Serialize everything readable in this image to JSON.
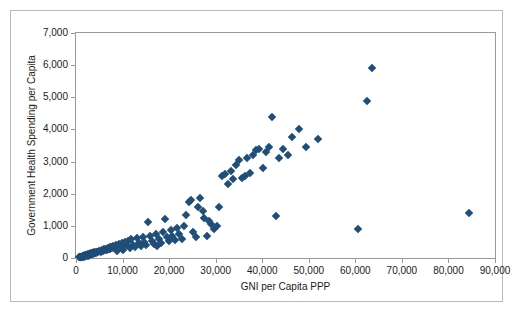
{
  "chart_data": {
    "type": "scatter",
    "title": "",
    "xlabel": "GNI per Capita PPP",
    "ylabel": "Government Health Spending per Capita",
    "xlim": [
      0,
      90000
    ],
    "ylim": [
      0,
      7000
    ],
    "xticks": [
      0,
      10000,
      20000,
      30000,
      40000,
      50000,
      60000,
      70000,
      80000,
      90000
    ],
    "xticklabels": [
      "0",
      "10,000",
      "20,000",
      "30,000",
      "40,000",
      "50,000",
      "60,000",
      "70,000",
      "80,000",
      "90,000"
    ],
    "yticks": [
      0,
      1000,
      2000,
      3000,
      4000,
      5000,
      6000,
      7000
    ],
    "yticklabels": [
      "0",
      "1,000",
      "2,000",
      "3,000",
      "4,000",
      "5,000",
      "6,000",
      "7,000"
    ],
    "grid": false,
    "legend": false,
    "marker": "diamond",
    "marker_color": "#1F4E79",
    "series": [
      {
        "name": "Countries",
        "points": [
          [
            600,
            20
          ],
          [
            800,
            25
          ],
          [
            900,
            30
          ],
          [
            1000,
            35
          ],
          [
            1100,
            40
          ],
          [
            1200,
            45
          ],
          [
            1300,
            30
          ],
          [
            1400,
            55
          ],
          [
            1500,
            60
          ],
          [
            1600,
            50
          ],
          [
            1700,
            70
          ],
          [
            1800,
            45
          ],
          [
            1900,
            80
          ],
          [
            2000,
            60
          ],
          [
            2100,
            90
          ],
          [
            2200,
            70
          ],
          [
            2300,
            100
          ],
          [
            2400,
            85
          ],
          [
            2500,
            110
          ],
          [
            2600,
            75
          ],
          [
            2700,
            120
          ],
          [
            2800,
            95
          ],
          [
            2900,
            130
          ],
          [
            3000,
            105
          ],
          [
            3100,
            140
          ],
          [
            3200,
            115
          ],
          [
            3300,
            150
          ],
          [
            3400,
            125
          ],
          [
            3500,
            160
          ],
          [
            3600,
            135
          ],
          [
            3700,
            170
          ],
          [
            3800,
            145
          ],
          [
            3900,
            180
          ],
          [
            4000,
            155
          ],
          [
            4200,
            190
          ],
          [
            4400,
            165
          ],
          [
            4600,
            200
          ],
          [
            4800,
            175
          ],
          [
            5000,
            210
          ],
          [
            5200,
            230
          ],
          [
            5400,
            195
          ],
          [
            5600,
            250
          ],
          [
            5800,
            215
          ],
          [
            6000,
            270
          ],
          [
            6200,
            235
          ],
          [
            6400,
            290
          ],
          [
            6600,
            255
          ],
          [
            6800,
            310
          ],
          [
            7000,
            275
          ],
          [
            7200,
            330
          ],
          [
            7400,
            295
          ],
          [
            7600,
            350
          ],
          [
            7800,
            315
          ],
          [
            8000,
            370
          ],
          [
            8300,
            340
          ],
          [
            8600,
            400
          ],
          [
            8900,
            230
          ],
          [
            9200,
            430
          ],
          [
            9500,
            360
          ],
          [
            9800,
            470
          ],
          [
            10200,
            260
          ],
          [
            10500,
            500
          ],
          [
            10800,
            390
          ],
          [
            11200,
            540
          ],
          [
            11500,
            300
          ],
          [
            11900,
            580
          ],
          [
            12300,
            420
          ],
          [
            12700,
            330
          ],
          [
            13100,
            620
          ],
          [
            13500,
            460
          ],
          [
            13900,
            360
          ],
          [
            14300,
            660
          ],
          [
            14700,
            500
          ],
          [
            15100,
            400
          ],
          [
            15500,
            1120
          ],
          [
            15900,
            700
          ],
          [
            16300,
            540
          ],
          [
            16700,
            440
          ],
          [
            17100,
            760
          ],
          [
            17500,
            380
          ],
          [
            17900,
            600
          ],
          [
            18300,
            480
          ],
          [
            18700,
            820
          ],
          [
            19100,
            1200
          ],
          [
            19500,
            640
          ],
          [
            19900,
            520
          ],
          [
            20300,
            880
          ],
          [
            20700,
            700
          ],
          [
            21200,
            560
          ],
          [
            21700,
            940
          ],
          [
            22200,
            760
          ],
          [
            22700,
            600
          ],
          [
            23200,
            1000
          ],
          [
            23700,
            1350
          ],
          [
            24200,
            1740
          ],
          [
            24700,
            1800
          ],
          [
            25200,
            820
          ],
          [
            25700,
            660
          ],
          [
            26200,
            1600
          ],
          [
            26700,
            1860
          ],
          [
            27200,
            1450
          ],
          [
            27600,
            1250
          ],
          [
            28100,
            700
          ],
          [
            28600,
            1150
          ],
          [
            29100,
            1050
          ],
          [
            29600,
            900
          ],
          [
            30200,
            1000
          ],
          [
            30800,
            1600
          ],
          [
            31400,
            2550
          ],
          [
            32000,
            2600
          ],
          [
            32600,
            2300
          ],
          [
            33200,
            2700
          ],
          [
            33800,
            2450
          ],
          [
            34400,
            2900
          ],
          [
            35000,
            3050
          ],
          [
            35600,
            2500
          ],
          [
            36200,
            2550
          ],
          [
            36800,
            3100
          ],
          [
            37400,
            2650
          ],
          [
            38000,
            3200
          ],
          [
            38700,
            3350
          ],
          [
            39400,
            3400
          ],
          [
            40100,
            2800
          ],
          [
            40800,
            3300
          ],
          [
            41500,
            3450
          ],
          [
            42200,
            4400
          ],
          [
            42900,
            1300
          ],
          [
            43600,
            3100
          ],
          [
            44500,
            3400
          ],
          [
            45500,
            3200
          ],
          [
            46500,
            3750
          ],
          [
            47800,
            4000
          ],
          [
            49500,
            3450
          ],
          [
            52000,
            3700
          ],
          [
            60500,
            900
          ],
          [
            62500,
            4900
          ],
          [
            63500,
            5900
          ],
          [
            84500,
            1400
          ]
        ]
      }
    ]
  }
}
